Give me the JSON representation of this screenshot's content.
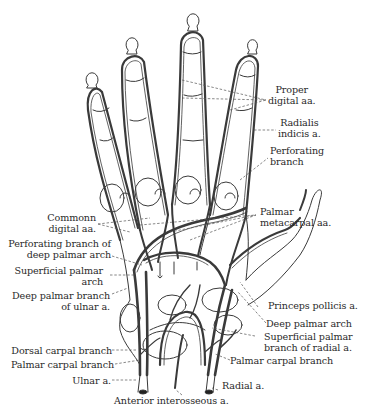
{
  "figure": {
    "line_color": "#3a3a3a",
    "leader_color": "#555555",
    "background": "#ffffff"
  },
  "labels": {
    "proper_digital": [
      "Proper",
      "digital aa."
    ],
    "radialis_indicis": [
      "Radialis",
      "indicis a."
    ],
    "perforating_branch": [
      "Perforating",
      "branch"
    ],
    "palmar_metacarpal": [
      "Palmar",
      "metacarpal aa."
    ],
    "common_digital": [
      "Commonn",
      "digital aa."
    ],
    "perforating_deep": [
      "Perforating branch of",
      "deep palmar arch"
    ],
    "superficial_arch": [
      "Superficial palmar",
      "arch"
    ],
    "deep_branch_ulnar": [
      "Deep palmar branch",
      "of ulnar a."
    ],
    "princeps_pollicis": [
      "Princeps pollicis a."
    ],
    "deep_palmar_arch": [
      "Deep palmar arch"
    ],
    "superficial_radial": [
      "Superficial palmar",
      "branch of radial a."
    ],
    "palmar_carpal_right": [
      "Palmar carpal branch"
    ],
    "dorsal_carpal": [
      "Dorsal carpal branch"
    ],
    "palmar_carpal_left": [
      "Palmar carpal branch"
    ],
    "ulnar": [
      "Ulnar a."
    ],
    "radial": [
      "Radial a."
    ],
    "anterior_interosseous": [
      "Anterior interosseous a."
    ]
  }
}
